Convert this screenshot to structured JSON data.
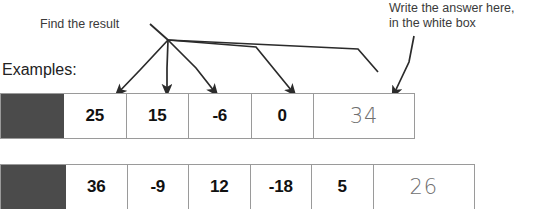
{
  "page": {
    "cutoff_text_top": "",
    "examples_label": "Examples:"
  },
  "annotations": {
    "find_result": {
      "text": "Find the result",
      "target_count": 4
    },
    "write_answer": {
      "line1": "Write the answer here,",
      "line2": "in the white box"
    }
  },
  "colors": {
    "dark_block": "#4b4b4b",
    "grid_line": "#9a9a9a",
    "printed_number": "#111111",
    "handwriting": "#6f6f6f",
    "annotation_text": "#3a3a3a",
    "page_background": "#ffffff"
  },
  "rows": [
    {
      "id": "row-1",
      "leading_block": "",
      "numbers": [
        "25",
        "15",
        "-6",
        "0"
      ],
      "answer": "34",
      "answer_is_handwritten": true
    },
    {
      "id": "row-2",
      "leading_block": "",
      "numbers": [
        "36",
        "-9",
        "12",
        "-18",
        "5"
      ],
      "answer": "26",
      "answer_is_handwritten": true
    }
  ]
}
